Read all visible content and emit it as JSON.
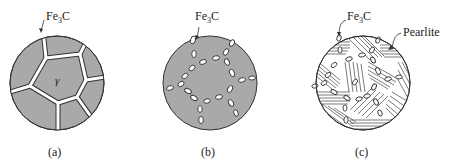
{
  "colors": {
    "matrix_fill": "#a9a9a9",
    "outline": "#333333",
    "cementite": "#ffffff",
    "text": "#222222"
  },
  "panels": [
    {
      "id": "a",
      "caption": "(a)",
      "annotation": "Fe3C",
      "annotation_main": "Fe",
      "annotation_sub": "3",
      "annotation_tail": "C",
      "phase_label": "γ",
      "description": "Austenite grains with continuous Fe3C network at grain boundaries"
    },
    {
      "id": "b",
      "caption": "(b)",
      "annotation_main": "Fe",
      "annotation_sub": "3",
      "annotation_tail": "C",
      "description": "Fe3C spheroidized into discrete particles along former grain boundaries"
    },
    {
      "id": "c",
      "caption": "(c)",
      "annotation_main": "Fe",
      "annotation_sub": "3",
      "annotation_tail": "C",
      "annotation2": "Pearlite",
      "description": "Pearlite matrix (lamellar) with Fe3C particles"
    }
  ]
}
